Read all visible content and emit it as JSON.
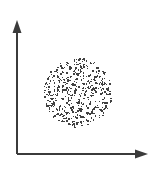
{
  "figure": {
    "width": 156,
    "height": 170,
    "background_color": "#ffffff",
    "title": "",
    "caption": ""
  },
  "axes": {
    "origin_x": 17,
    "origin_y": 154,
    "y_axis_top_y": 20,
    "x_axis_right_x": 148,
    "line_color": "#3b3b3b",
    "line_width": 2,
    "arrowhead_length": 13,
    "arrowhead_width": 9,
    "x_axis_label": "",
    "y_axis_label": "",
    "ticks": []
  },
  "chart_data": {
    "type": "scatter",
    "title": "",
    "subtitle": "",
    "xlabel": "",
    "ylabel": "",
    "xlim": [
      0,
      156
    ],
    "ylim": [
      0,
      170
    ],
    "grid": false,
    "legend": null,
    "annotations": [],
    "point_color": "#404040",
    "point_size": 1.4,
    "point_shape": "square",
    "point_count": 520,
    "cluster": {
      "shape": "disk",
      "distribution": "uniform",
      "center_x": 78,
      "center_y": 93,
      "radius": 34.5,
      "random_seed": 20240517
    },
    "series": [
      {
        "name": "points",
        "color": "#404040",
        "description": "uniformly scattered points filling a circular disk"
      }
    ]
  }
}
